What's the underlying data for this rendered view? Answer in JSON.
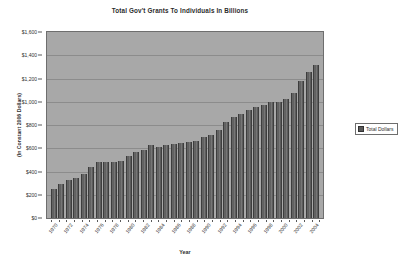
{
  "chart_data": {
    "type": "bar",
    "title": "Total Gov't Grants To Individuals In Billions",
    "xlabel": "Year",
    "ylabel": "(In Constant 2006 Dollars)",
    "ylim": [
      0,
      1600
    ],
    "ytick_labels": [
      "$1,600",
      "$1,400",
      "$1,200",
      "$1,000",
      "$800",
      "$600",
      "$400",
      "$200",
      "$0"
    ],
    "ytick_values": [
      1600,
      1400,
      1200,
      1000,
      800,
      600,
      400,
      200,
      0
    ],
    "grid": true,
    "legend_position": "right",
    "legend": [
      "Total Dollars"
    ],
    "categories": [
      "1970",
      "1971",
      "1972",
      "1973",
      "1974",
      "1975",
      "1976",
      "1977",
      "1978",
      "1979",
      "1980",
      "1981",
      "1982",
      "1983",
      "1984",
      "1985",
      "1986",
      "1987",
      "1988",
      "1989",
      "1990",
      "1991",
      "1992",
      "1993",
      "1994",
      "1995",
      "1996",
      "1997",
      "1998",
      "1999",
      "2000",
      "2001",
      "2002",
      "2003",
      "2004",
      "2005"
    ],
    "xtick_labels": [
      "1970",
      "1972",
      "1974",
      "1976",
      "1978",
      "1980",
      "1982",
      "1984",
      "1986",
      "1988",
      "1990",
      "1992",
      "1994",
      "1996",
      "1998",
      "2000",
      "2002",
      "2004"
    ],
    "series": [
      {
        "name": "Total Dollars",
        "values": [
          250,
          295,
          325,
          345,
          375,
          435,
          480,
          485,
          485,
          490,
          535,
          570,
          585,
          625,
          610,
          625,
          635,
          645,
          650,
          665,
          700,
          715,
          760,
          830,
          865,
          895,
          930,
          955,
          975,
          995,
          1000,
          1020,
          1075,
          1175,
          1255,
          1320
        ]
      }
    ]
  },
  "legend": {
    "items": [
      {
        "label": "Total Dollars",
        "color": "#5a5a5a"
      }
    ]
  },
  "colors": {
    "plot_background": "#a8a8a8",
    "bar": "#5a5a5a",
    "gridline": "#8c8c8c",
    "axis": "#5a5a5a",
    "text": "#2f2f2f",
    "page_background": "#ffffff"
  }
}
